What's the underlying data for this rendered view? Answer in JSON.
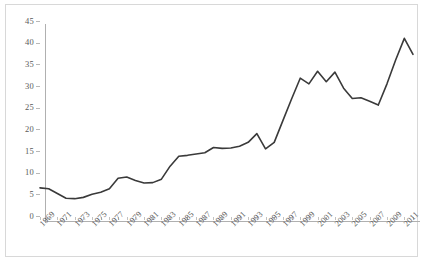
{
  "chart_data": {
    "type": "line",
    "title": "",
    "subtitle": "",
    "xlabel": "",
    "ylabel": "",
    "xlim": [
      1969,
      2012
    ],
    "ylim": [
      0,
      45
    ],
    "yticks": [
      0,
      5,
      10,
      15,
      20,
      25,
      30,
      35,
      40,
      45
    ],
    "xticks": [
      1969,
      1971,
      1973,
      1975,
      1977,
      1979,
      1981,
      1983,
      1985,
      1987,
      1989,
      1991,
      1993,
      1995,
      1997,
      1999,
      2001,
      2003,
      2005,
      2007,
      2009,
      2011
    ],
    "xtick_labels": [
      "1969",
      "1971",
      "1973",
      "1975",
      "1977",
      "1979",
      "1981",
      "1983",
      "1985",
      "1987",
      "1989",
      "1991",
      "1993",
      "1995",
      "1997",
      "1999",
      "2001",
      "2003",
      "2005",
      "2007",
      "2009",
      "2011"
    ],
    "xtick_rotation": -45,
    "grid": false,
    "legend": false,
    "legend_position": "none",
    "line_color": "#3a3a3a",
    "line_width": 1.6,
    "markers": false,
    "series": [
      {
        "name": "series-1",
        "x": [
          1969,
          1970,
          1971,
          1972,
          1973,
          1974,
          1975,
          1976,
          1977,
          1978,
          1979,
          1980,
          1981,
          1982,
          1983,
          1984,
          1985,
          1986,
          1987,
          1988,
          1989,
          1990,
          1991,
          1992,
          1993,
          1994,
          1995,
          1996,
          1997,
          1998,
          1999,
          2000,
          2001,
          2002,
          2003,
          2004,
          2005,
          2006,
          2007,
          2008,
          2009,
          2010,
          2011,
          2012
        ],
        "values": [
          6.5,
          6.3,
          5.2,
          4.1,
          4.0,
          4.3,
          5.0,
          5.5,
          6.3,
          8.7,
          9.0,
          8.2,
          7.6,
          7.7,
          8.5,
          11.5,
          13.8,
          14.0,
          14.3,
          14.6,
          15.8,
          15.6,
          15.7,
          16.1,
          17.0,
          19.0,
          15.5,
          17.0,
          22.0,
          27.0,
          31.8,
          30.5,
          33.4,
          31.0,
          33.2,
          29.5,
          27.1,
          27.3,
          26.5,
          25.6,
          30.5,
          36.0,
          41.0,
          37.3
        ]
      }
    ]
  },
  "axis": {
    "ytick_labels": [
      "45",
      "40",
      "35",
      "30",
      "25",
      "20",
      "15",
      "10",
      "5",
      "0"
    ]
  }
}
